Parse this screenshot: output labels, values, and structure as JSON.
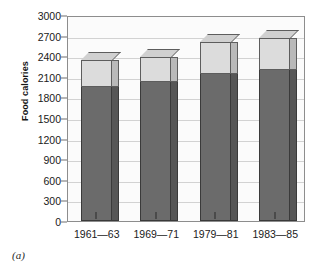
{
  "figure": {
    "caption": "(a)"
  },
  "chart_data": {
    "type": "bar",
    "subtype": "stacked-3d-column",
    "title": "",
    "xlabel": "",
    "ylabel": "Food calories",
    "ylim": [
      0,
      3000
    ],
    "ytick_step": 300,
    "ytick_labels": [
      "0",
      "300",
      "600",
      "900",
      "1200",
      "1500",
      "1800",
      "2100",
      "2400",
      "2700",
      "3000"
    ],
    "ytick_values": [
      0,
      300,
      600,
      900,
      1200,
      1500,
      1800,
      2100,
      2400,
      2700,
      3000
    ],
    "grid": true,
    "legend": "none",
    "categories": [
      "1961—63",
      "1969—71",
      "1979—81",
      "1983—85"
    ],
    "series": [
      {
        "name": "lower-segment",
        "color": "#6b6b6b",
        "values": [
          1950,
          2030,
          2140,
          2200
        ]
      },
      {
        "name": "upper-segment",
        "color": "#dcdcdc",
        "values": [
          400,
          360,
          470,
          470
        ]
      }
    ],
    "totals": [
      2350,
      2390,
      2610,
      2670
    ]
  }
}
